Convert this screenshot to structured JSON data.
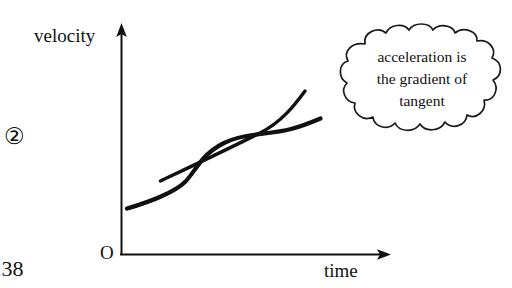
{
  "diagram": {
    "type": "velocity-time graph with tangent line",
    "axes": {
      "y_label": "velocity",
      "x_label": "time",
      "origin_label": "O"
    },
    "annotation": {
      "shape": "thought-cloud",
      "lines": [
        "acceleration is",
        "the gradient of",
        "tangent"
      ]
    },
    "figure_number": "②",
    "page_number": ".38",
    "colors": {
      "ink": "#111111",
      "background": "#ffffff"
    },
    "curve": {
      "name": "velocity-curve",
      "description": "hand drawn increasing velocity curve, shallow then steeper then flattening"
    },
    "tangent": {
      "name": "tangent-line",
      "description": "straight hand drawn tangent touching the curve at its steepest portion"
    }
  }
}
